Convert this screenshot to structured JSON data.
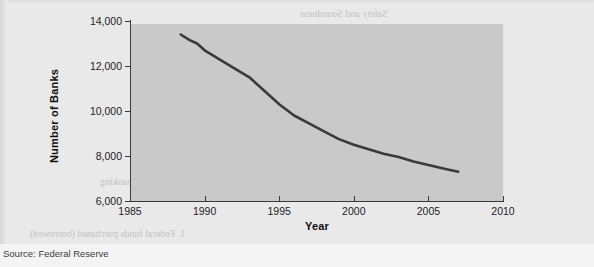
{
  "page": {
    "source_note": "Source: Federal Reserve"
  },
  "chart_data": {
    "type": "line",
    "title": "",
    "xlabel": "Year",
    "ylabel": "Number of Banks",
    "xlim": [
      1985,
      2010
    ],
    "ylim": [
      6000,
      14000
    ],
    "xticks": [
      "1985",
      "1990",
      "1995",
      "2000",
      "2005",
      "2010"
    ],
    "yticks": [
      "6,000",
      "8,000",
      "10,000",
      "12,000",
      "14,000"
    ],
    "grid": false,
    "legend": "none",
    "line_color": "#3a3a3a",
    "plot_background": "#c9c9c9",
    "series": [
      {
        "name": "Number of Banks",
        "x": [
          1988.4,
          1989,
          1989.5,
          1990,
          1991,
          1992,
          1993,
          1994,
          1995,
          1996,
          1997,
          1998,
          1999,
          2000,
          2001,
          2002,
          2003,
          2004,
          2005,
          2006,
          2007
        ],
        "values": [
          13400,
          13150,
          13000,
          12700,
          12300,
          11900,
          11500,
          10900,
          10300,
          9800,
          9450,
          9100,
          8750,
          8500,
          8300,
          8100,
          7950,
          7750,
          7600,
          7450,
          7300
        ]
      }
    ]
  },
  "bleed_text": {
    "lines": [
      "Safety and Soundness",
      "Summary Points",
      "1. Federal funds purchased (borrowed)",
      "2. Borrowings from the Federal Reserve",
      "3. Repurchase agreements",
      "4. Standby Credit Lines",
      "Long-Term Sources of Funds",
      "5. Bank capital accounts",
      "6. Subordinated notes and debentures",
      "and the growth of funds invested in banking"
    ]
  }
}
